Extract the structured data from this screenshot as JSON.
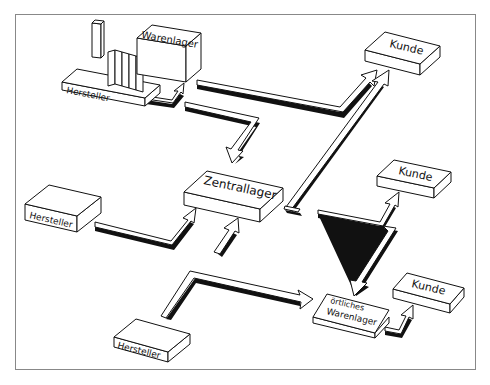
{
  "diagram": {
    "type": "logistics-distribution-flow",
    "frame_color": "#888888",
    "line_color": "#111111",
    "fill_color": "#ffffff",
    "nodes": [
      {
        "id": "factory",
        "label": "Hersteller",
        "kind": "factory"
      },
      {
        "id": "factory_warehouse",
        "label": "Warenlager",
        "kind": "warehouse"
      },
      {
        "id": "kunde_top",
        "label": "Kunde",
        "kind": "customer"
      },
      {
        "id": "hersteller_mid",
        "label": "Hersteller",
        "kind": "producer"
      },
      {
        "id": "zentrallager",
        "label": "Zentrallager",
        "kind": "central-warehouse"
      },
      {
        "id": "kunde_mid",
        "label": "Kunde",
        "kind": "customer"
      },
      {
        "id": "hersteller_bottom",
        "label": "Hersteller",
        "kind": "producer"
      },
      {
        "id": "oertliches_warenlager",
        "label_line1": "örtliches",
        "label_line2": "Warenlager",
        "kind": "local-warehouse"
      },
      {
        "id": "kunde_bottom",
        "label": "Kunde",
        "kind": "customer"
      }
    ],
    "edges": [
      {
        "from": "factory",
        "to": "factory_warehouse"
      },
      {
        "from": "factory_warehouse",
        "to": "kunde_top"
      },
      {
        "from": "factory_warehouse",
        "to": "zentrallager"
      },
      {
        "from": "hersteller_mid",
        "to": "zentrallager"
      },
      {
        "from": "external",
        "to": "zentrallager"
      },
      {
        "from": "zentrallager",
        "to": "kunde_top"
      },
      {
        "from": "zentrallager",
        "to": "kunde_mid"
      },
      {
        "from": "zentrallager",
        "to": "oertliches_warenlager"
      },
      {
        "from": "hersteller_bottom",
        "to": "oertliches_warenlager"
      },
      {
        "from": "oertliches_warenlager",
        "to": "kunde_bottom"
      }
    ]
  }
}
